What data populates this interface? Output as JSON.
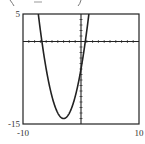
{
  "chart_data": {
    "type": "line",
    "title": "",
    "header_fragment": "(   )",
    "xlabel": "",
    "ylabel": "",
    "xlim": [
      -10,
      10
    ],
    "ylim": [
      -15,
      5
    ],
    "x_tick_step": 1,
    "y_tick_step": 1,
    "x_tick_labels": [
      {
        "value": -10,
        "label": "-10"
      },
      {
        "value": 10,
        "label": "10"
      }
    ],
    "y_tick_labels": [
      {
        "value": 5,
        "label": "5"
      },
      {
        "value": -15,
        "label": "-15"
      }
    ],
    "grid": false,
    "series": [
      {
        "name": "y = x^2 + 6x - 5",
        "function": {
          "a": 1,
          "b": 6,
          "c": -5
        },
        "vertex": [
          -3,
          -14
        ],
        "roots": [
          -6.74,
          0.74
        ],
        "y_intercept": -5
      }
    ]
  }
}
